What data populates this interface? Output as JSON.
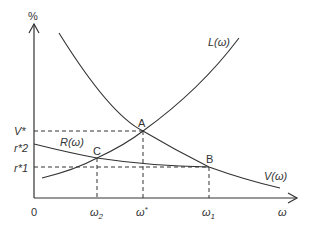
{
  "diagram": {
    "y_axis_label": "%",
    "x_axis_label": "ω",
    "origin_label": "0",
    "y_ticks": [
      {
        "label": "V*",
        "y": 131
      },
      {
        "label": "r*2",
        "y": 147
      },
      {
        "label": "r*1",
        "y": 167
      }
    ],
    "x_ticks": [
      {
        "label": "ω2",
        "base": "ω",
        "sub": "2",
        "x": 97
      },
      {
        "label": "ω*",
        "base": "ω",
        "sub": "*",
        "x": 143
      },
      {
        "label": "ω1",
        "base": "ω",
        "sub": "1",
        "x": 209
      }
    ],
    "curves": [
      {
        "name": "L(ω)",
        "label": "L(ω)"
      },
      {
        "name": "V(ω)",
        "label": "V(ω)"
      },
      {
        "name": "R(ω)",
        "label": "R(ω)"
      }
    ],
    "points": [
      {
        "label": "A",
        "x": 143,
        "y": 131
      },
      {
        "label": "B",
        "x": 209,
        "y": 167
      },
      {
        "label": "C",
        "x": 97,
        "y": 158
      }
    ],
    "colors": {
      "line": "#333333",
      "background": "#ffffff"
    }
  }
}
